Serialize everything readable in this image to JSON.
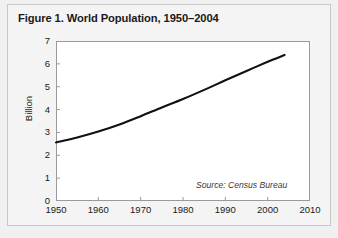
{
  "figure": {
    "title": "Figure 1. World Population, 1950–2004",
    "source_note": "Source: Census Bureau",
    "background_color": "#f4f4f4",
    "plot_background_color": "#ffffff",
    "frame_color": "#9a9a9a",
    "line_color": "#111111"
  },
  "chart_data": {
    "type": "line",
    "title": "Figure 1. World Population, 1950–2004",
    "xlabel": "",
    "ylabel": "Billion",
    "xlim": [
      1950,
      2010
    ],
    "ylim": [
      0,
      7
    ],
    "xticks": [
      1950,
      1960,
      1970,
      1980,
      1990,
      2000,
      2010
    ],
    "xtick_labels": [
      "1950",
      "1960",
      "1970",
      "1980",
      "1990",
      "2000",
      "2010"
    ],
    "yticks": [
      0,
      1,
      2,
      3,
      4,
      5,
      6,
      7
    ],
    "ytick_labels": [
      "0",
      "1",
      "2",
      "3",
      "4",
      "5",
      "6",
      "7"
    ],
    "grid": false,
    "legend": null,
    "annotations": [
      "Source: Census Bureau"
    ],
    "series": [
      {
        "name": "World Population",
        "units": "Billion",
        "x": [
          1950,
          1955,
          1960,
          1965,
          1970,
          1975,
          1980,
          1985,
          1990,
          1995,
          2000,
          2004
        ],
        "values": [
          2.56,
          2.78,
          3.04,
          3.35,
          3.71,
          4.09,
          4.46,
          4.86,
          5.28,
          5.69,
          6.09,
          6.39
        ]
      }
    ]
  }
}
